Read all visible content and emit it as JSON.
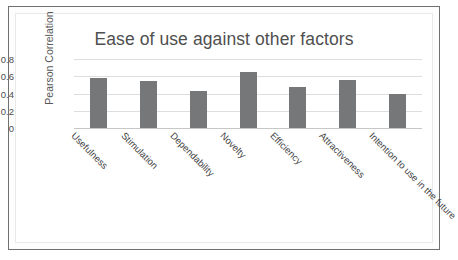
{
  "chart_data": {
    "type": "bar",
    "title": "Ease of use against other factors",
    "xlabel": "",
    "ylabel": "Pearson Correlation",
    "categories": [
      "Usefulness",
      "Stimulation",
      "Dependability",
      "Novelty",
      "Efficiency",
      "Attractiveness",
      "Intention to use in the future"
    ],
    "values": [
      0.58,
      0.54,
      0.43,
      0.65,
      0.48,
      0.56,
      0.39
    ],
    "ylim": [
      0,
      0.8
    ],
    "yticks": [
      "0.8",
      "0.6",
      "0.4",
      "0.2",
      "0"
    ],
    "ytick_values": [
      0.8,
      0.6,
      0.4,
      0.2,
      0
    ],
    "grid": true,
    "legend": false,
    "bar_color": "#757779",
    "gridline_color": "#dededf",
    "title_color": "#4f4f4f"
  }
}
